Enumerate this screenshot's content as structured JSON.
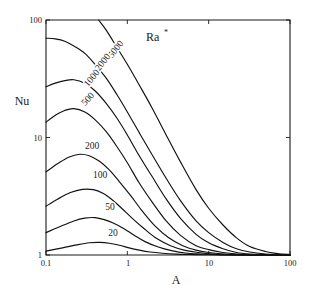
{
  "chart_data": {
    "type": "line",
    "title": "",
    "xlabel": "A",
    "ylabel": "Nu",
    "legend_title": "Ra*",
    "legend_position": "in-plot-top-right",
    "xscale": "log",
    "yscale": "log",
    "xlim": [
      0.1,
      100
    ],
    "ylim": [
      1,
      100
    ],
    "xticks": [
      "0.1",
      "1",
      "10",
      "100"
    ],
    "yticks": [
      "1",
      "10",
      "100"
    ],
    "grid": false,
    "series": [
      {
        "name": "5000",
        "label": "5000",
        "x": [
          0.1,
          0.13,
          0.17,
          0.22,
          0.3,
          0.4,
          0.55,
          0.75,
          1.0,
          1.4,
          2.0,
          3.0,
          4.5,
          7.0,
          10.0,
          15.0,
          22.0,
          32.0,
          50.0,
          70.0,
          100.0
        ],
        "y": [
          230,
          215,
          195,
          170,
          140,
          110,
          82,
          58,
          42,
          28,
          18,
          10.5,
          6.2,
          3.6,
          2.5,
          1.8,
          1.4,
          1.18,
          1.07,
          1.03,
          1.01
        ]
      },
      {
        "name": "2000",
        "label": "2000",
        "x": [
          0.1,
          0.13,
          0.17,
          0.22,
          0.3,
          0.4,
          0.55,
          0.75,
          1.0,
          1.4,
          2.0,
          3.0,
          4.5,
          7.0,
          10.0,
          15.0,
          22.0,
          32.0,
          50.0,
          70.0,
          100.0
        ],
        "y": [
          70,
          69,
          66,
          60,
          52,
          42,
          32,
          23,
          16.5,
          11.0,
          7.2,
          4.5,
          2.9,
          1.95,
          1.55,
          1.28,
          1.13,
          1.06,
          1.02,
          1.01,
          1.0
        ]
      },
      {
        "name": "1000",
        "label": "1000",
        "x": [
          0.1,
          0.13,
          0.17,
          0.22,
          0.3,
          0.4,
          0.55,
          0.75,
          1.0,
          1.4,
          2.0,
          3.0,
          4.5,
          7.0,
          10.0,
          15.0,
          22.0,
          32.0,
          50.0,
          100.0
        ],
        "y": [
          27,
          29,
          30.5,
          31,
          29,
          25,
          19.5,
          14.5,
          10.5,
          7.0,
          4.7,
          3.0,
          2.05,
          1.5,
          1.27,
          1.13,
          1.05,
          1.02,
          1.01,
          1.0
        ]
      },
      {
        "name": "500",
        "label": "500",
        "x": [
          0.1,
          0.13,
          0.17,
          0.22,
          0.3,
          0.4,
          0.55,
          0.75,
          1.0,
          1.4,
          2.0,
          3.0,
          4.5,
          7.0,
          10.0,
          15.0,
          22.0,
          32.0,
          50.0,
          100.0
        ],
        "y": [
          13.5,
          15.5,
          17.0,
          17.6,
          16.5,
          14.2,
          11.2,
          8.3,
          6.1,
          4.1,
          2.85,
          1.95,
          1.47,
          1.2,
          1.11,
          1.05,
          1.02,
          1.01,
          1.0,
          1.0
        ]
      },
      {
        "name": "200",
        "label": "200",
        "x": [
          0.1,
          0.14,
          0.19,
          0.26,
          0.34,
          0.45,
          0.6,
          0.8,
          1.1,
          1.5,
          2.2,
          3.2,
          4.8,
          7.0,
          10.0,
          15.0,
          22.0,
          40.0,
          100.0
        ],
        "y": [
          5.1,
          6.0,
          6.8,
          7.2,
          7.0,
          6.3,
          5.3,
          4.2,
          3.2,
          2.4,
          1.76,
          1.41,
          1.2,
          1.1,
          1.05,
          1.02,
          1.01,
          1.0,
          1.0
        ]
      },
      {
        "name": "100",
        "label": "100",
        "x": [
          0.1,
          0.14,
          0.2,
          0.28,
          0.38,
          0.5,
          0.65,
          0.85,
          1.15,
          1.6,
          2.3,
          3.4,
          5.0,
          7.5,
          11.0,
          17.0,
          30.0,
          100.0
        ],
        "y": [
          2.6,
          3.0,
          3.4,
          3.62,
          3.6,
          3.35,
          2.95,
          2.5,
          2.05,
          1.68,
          1.38,
          1.2,
          1.1,
          1.05,
          1.02,
          1.01,
          1.0,
          1.0
        ]
      },
      {
        "name": "50",
        "label": "50",
        "x": [
          0.1,
          0.15,
          0.22,
          0.3,
          0.4,
          0.52,
          0.68,
          0.9,
          1.2,
          1.65,
          2.4,
          3.5,
          5.2,
          8.0,
          12.0,
          20.0,
          40.0,
          100.0
        ],
        "y": [
          1.55,
          1.75,
          1.95,
          2.06,
          2.08,
          2.0,
          1.86,
          1.68,
          1.48,
          1.3,
          1.17,
          1.09,
          1.04,
          1.02,
          1.01,
          1.0,
          1.0,
          1.0
        ]
      },
      {
        "name": "20",
        "label": "20",
        "x": [
          0.1,
          0.16,
          0.24,
          0.34,
          0.46,
          0.6,
          0.8,
          1.05,
          1.4,
          1.9,
          2.7,
          4.0,
          6.0,
          9.0,
          14.0,
          25.0,
          50.0,
          100.0
        ],
        "y": [
          1.08,
          1.15,
          1.22,
          1.27,
          1.28,
          1.26,
          1.21,
          1.15,
          1.1,
          1.06,
          1.035,
          1.018,
          1.01,
          1.005,
          1.002,
          1.0,
          1.0,
          1.0
        ]
      }
    ],
    "curve_labels": [
      {
        "text": "5000",
        "x_px": 118,
        "y_px": 51,
        "rotation": -52
      },
      {
        "text": "2000",
        "x_px": 105,
        "y_px": 64,
        "rotation": -52
      },
      {
        "text": "1000",
        "x_px": 94,
        "y_px": 80,
        "rotation": -50
      },
      {
        "text": "500",
        "x_px": 90,
        "y_px": 101,
        "rotation": -48
      },
      {
        "text": "200",
        "x_px": 92,
        "y_px": 149,
        "rotation": 0
      },
      {
        "text": "100",
        "x_px": 100,
        "y_px": 178,
        "rotation": 0
      },
      {
        "text": "50",
        "x_px": 110,
        "y_px": 210,
        "rotation": 0
      },
      {
        "text": "20",
        "x_px": 113,
        "y_px": 236,
        "rotation": 0
      }
    ]
  },
  "axes": {
    "x_title": "A",
    "y_title": "Nu",
    "legend_base": "Ra",
    "legend_superscript": "*",
    "x_tick_labels": [
      "0.1",
      "1",
      "10",
      "100"
    ],
    "y_tick_labels": [
      "100",
      "10",
      "1"
    ]
  },
  "colors": {
    "line": "#111111",
    "axis": "#1a1a1a",
    "background": "#ffffff"
  }
}
